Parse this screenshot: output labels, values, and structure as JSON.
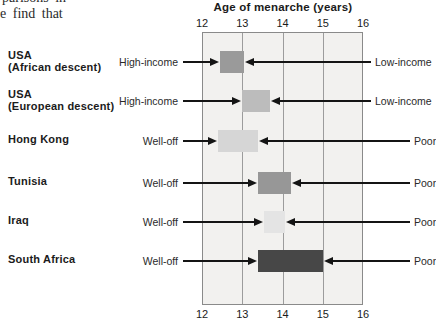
{
  "page_text": {
    "clipped_line": "parisons in",
    "visible_line": "e find that"
  },
  "chart_data": {
    "type": "range-bar",
    "title": "Age of menarche (years)",
    "xlabel": "Age of menarche (years)",
    "xlim": [
      12,
      16
    ],
    "ticks": [
      "12",
      "13",
      "14",
      "15",
      "16"
    ],
    "grid_ticks": [
      13,
      14,
      15
    ],
    "plot_bg": "#f2f1ef",
    "rows": [
      {
        "country_lines": [
          "USA",
          "(African descent)"
        ],
        "left_label": "High-income",
        "right_label": "Low-income",
        "range": [
          12.45,
          13.05
        ],
        "color": "#9a9a9a"
      },
      {
        "country_lines": [
          "USA",
          "(European descent)"
        ],
        "left_label": "High-income",
        "right_label": "Low-income",
        "range": [
          13.0,
          13.7
        ],
        "color": "#bcbcbc"
      },
      {
        "country_lines": [
          "Hong Kong"
        ],
        "left_label": "Well-off",
        "right_label": "Poor",
        "range": [
          12.4,
          13.4
        ],
        "color": "#d6d6d6"
      },
      {
        "country_lines": [
          "Tunisia"
        ],
        "left_label": "Well-off",
        "right_label": "Poor",
        "range": [
          13.4,
          14.2
        ],
        "color": "#979797"
      },
      {
        "country_lines": [
          "Iraq"
        ],
        "left_label": "Well-off",
        "right_label": "Poor",
        "range": [
          13.55,
          14.05
        ],
        "color": "#e4e4e4"
      },
      {
        "country_lines": [
          "South Africa"
        ],
        "left_label": "Well-off",
        "right_label": "Poor",
        "range": [
          13.4,
          15.0
        ],
        "color": "#474747"
      }
    ]
  }
}
